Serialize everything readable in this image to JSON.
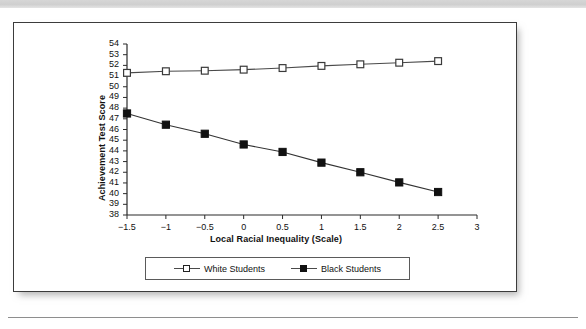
{
  "figure": {
    "caption": ""
  },
  "chart_data": {
    "type": "line",
    "title": "",
    "xlabel": "Local Racial Inequality (Scale)",
    "ylabel": "Achievement Test Score",
    "xlim": [
      -1.5,
      3
    ],
    "ylim": [
      38,
      54
    ],
    "xticks": [
      -1.5,
      -1,
      -0.5,
      0,
      0.5,
      1,
      1.5,
      2,
      2.5,
      3
    ],
    "xtick_labels": [
      "−1.5",
      "−1",
      "−0.5",
      "0",
      "0.5",
      "1",
      "1.5",
      "2",
      "2.5",
      "3"
    ],
    "yticks": [
      38,
      39,
      40,
      41,
      42,
      43,
      44,
      45,
      46,
      47,
      48,
      49,
      50,
      51,
      52,
      53,
      54
    ],
    "ytick_labels": [
      "38",
      "39",
      "40",
      "41",
      "42",
      "43",
      "44",
      "45",
      "46",
      "47",
      "48",
      "49",
      "50",
      "51",
      "52",
      "53",
      "54"
    ],
    "grid": false,
    "legend_position": "bottom",
    "x": [
      -1.5,
      -1.0,
      -0.5,
      0.0,
      0.5,
      1.0,
      1.5,
      2.0,
      2.5
    ],
    "series": [
      {
        "name": "White Students",
        "marker": "open-square",
        "color": "#111111",
        "line_color": "#4a4a4a",
        "values": [
          51.3,
          51.45,
          51.5,
          51.6,
          51.75,
          51.95,
          52.1,
          52.25,
          52.4
        ]
      },
      {
        "name": "Black Students",
        "marker": "filled-square",
        "color": "#111111",
        "line_color": "#333333",
        "values": [
          47.5,
          46.45,
          45.6,
          44.6,
          43.9,
          42.9,
          42.0,
          41.05,
          40.15
        ]
      }
    ]
  },
  "legend": {
    "entries": [
      {
        "label": "White Students",
        "marker": "open-square"
      },
      {
        "label": "Black Students",
        "marker": "filled-square"
      }
    ]
  }
}
